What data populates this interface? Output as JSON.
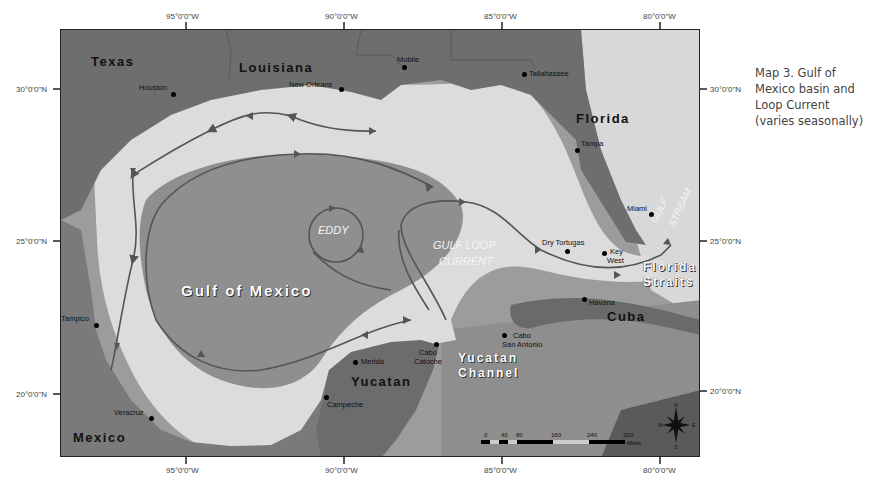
{
  "caption": "Map 3. Gulf of Mexico basin and Loop Current (varies seasonally)",
  "axes": {
    "top": [
      "95°0'0\"W",
      "90°0'0\"W",
      "85°0'0\"W",
      "80°0'0\"W"
    ],
    "bottom": [
      "95°0'0\"W",
      "90°0'0\"W",
      "85°0'0\"W",
      "80°0'0\"W"
    ],
    "left": [
      "30°0'0\"N",
      "25°0'0\"N",
      "20°0'0\"N"
    ],
    "right": [
      "30°0'0\"N",
      "25°0'0\"N",
      "20°0'0\"N"
    ]
  },
  "regions": {
    "texas": "Texas",
    "louisiana": "Louisiana",
    "florida": "Florida",
    "mexico": "Mexico",
    "yucatan": "Yucatan",
    "cuba": "Cuba",
    "gulf": "Gulf of Mexico",
    "yucatan_channel_1": "Yucatan",
    "yucatan_channel_2": "Channel",
    "florida_straits_1": "Florida",
    "florida_straits_2": "Straits"
  },
  "features": {
    "eddy": "EDDY",
    "loop_1": "GULF LOOP",
    "loop_2": "CURRENT",
    "gulf_stream_1": "GULF",
    "gulf_stream_2": "STREAM"
  },
  "cities": {
    "houston": "Houston",
    "new_orleans": "New Orleans",
    "mobile": "Mobile",
    "tallahassee": "Tallahassee",
    "tampa": "Tampa",
    "miami": "Miami",
    "dry_tortugas": "Dry Tortugas",
    "key_west_1": "Key",
    "key_west_2": "West",
    "havana": "Havana",
    "cabo_san_antonio_1": "Cabo",
    "cabo_san_antonio_2": "San Antonio",
    "cabo_catoche_1": "Cabo",
    "cabo_catoche_2": "Catoche",
    "merida": "Merida",
    "campeche": "Campeche",
    "tampico": "Tampico",
    "veracruz": "Veracruz"
  },
  "scale_bar": {
    "ticks": [
      "0",
      "40",
      "80",
      "160",
      "240",
      "320"
    ],
    "unit": "Miles"
  },
  "compass": {
    "n": "N",
    "s": "S",
    "e": "E",
    "w": "W"
  }
}
